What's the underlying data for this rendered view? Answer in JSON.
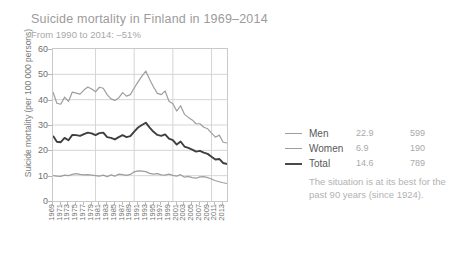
{
  "header": {
    "title": "Suicide mortality in Finland in 1969–2014",
    "subtitle": "From 1990 to 2014: –51%"
  },
  "annotation": {
    "text": "The situation is at its best for the past 90 years (since 1924)."
  },
  "legend": {
    "rows": [
      {
        "label": "Men",
        "rate": "22.9",
        "count": "599",
        "color": "#9e9e9e"
      },
      {
        "label": "Women",
        "rate": "6.9",
        "count": "190",
        "color": "#9e9e9e"
      },
      {
        "label": "Total",
        "rate": "14.6",
        "count": "789",
        "color": "#4a4a4a"
      }
    ]
  },
  "chart_data": {
    "type": "line",
    "title": "Suicide mortality in Finland in 1969–2014",
    "subtitle": "From 1990 to 2014: –51%",
    "xlabel": "",
    "ylabel": "Suicide mortality (per 100 000 persons)",
    "ylim": [
      0,
      60
    ],
    "yticks": [
      0,
      10,
      20,
      30,
      40,
      50,
      60
    ],
    "xlim": [
      1969,
      2014
    ],
    "grid": true,
    "legend_position": "right",
    "x": [
      1969,
      1970,
      1971,
      1972,
      1973,
      1974,
      1975,
      1976,
      1977,
      1978,
      1979,
      1980,
      1981,
      1982,
      1983,
      1984,
      1985,
      1986,
      1987,
      1988,
      1989,
      1990,
      1991,
      1992,
      1993,
      1994,
      1995,
      1996,
      1997,
      1998,
      1999,
      2000,
      2001,
      2002,
      2003,
      2004,
      2005,
      2006,
      2007,
      2008,
      2009,
      2010,
      2011,
      2012,
      2013,
      2014
    ],
    "xtick_labels": [
      "1969",
      "1971",
      "1973",
      "1975",
      "1977",
      "1979",
      "1981",
      "1983",
      "1985",
      "1987",
      "1989",
      "1991",
      "1993",
      "1995",
      "1997",
      "1999",
      "2001",
      "2003",
      "2005",
      "2007",
      "2009",
      "2011",
      "2013"
    ],
    "series": [
      {
        "name": "Men",
        "color": "#9e9e9e",
        "values": [
          43.0,
          38.6,
          38.2,
          41.0,
          39.3,
          43.0,
          42.6,
          42.2,
          43.8,
          45.0,
          44.2,
          43.1,
          44.9,
          44.5,
          42.0,
          40.3,
          39.7,
          40.7,
          42.8,
          41.4,
          42.0,
          44.6,
          47.0,
          49.3,
          51.3,
          48.0,
          45.0,
          42.5,
          42.0,
          43.4,
          39.4,
          38.4,
          35.5,
          37.6,
          34.2,
          33.0,
          32.0,
          30.5,
          30.5,
          29.1,
          28.5,
          26.8,
          25.2,
          26.0,
          23.2,
          22.9
        ]
      },
      {
        "name": "Women",
        "color": "#9e9e9e",
        "values": [
          10.0,
          9.8,
          9.7,
          10.2,
          10.0,
          10.5,
          10.8,
          10.5,
          10.3,
          10.4,
          10.2,
          10.0,
          9.8,
          10.2,
          9.6,
          10.3,
          9.8,
          10.6,
          10.4,
          10.1,
          10.5,
          11.5,
          11.9,
          11.8,
          11.6,
          10.9,
          10.6,
          10.8,
          10.3,
          10.2,
          10.6,
          10.1,
          9.8,
          10.4,
          9.4,
          9.7,
          9.2,
          9.0,
          9.5,
          9.6,
          9.2,
          8.7,
          8.0,
          7.6,
          7.2,
          6.9
        ]
      },
      {
        "name": "Total",
        "color": "#3f3f3f",
        "values": [
          25.7,
          23.4,
          23.2,
          24.9,
          24.0,
          26.1,
          26.0,
          25.7,
          26.4,
          27.0,
          26.7,
          26.0,
          26.8,
          27.0,
          25.2,
          24.9,
          24.3,
          25.2,
          26.0,
          25.2,
          25.6,
          27.4,
          29.0,
          30.0,
          30.9,
          29.0,
          27.3,
          26.1,
          25.7,
          26.3,
          24.6,
          24.0,
          22.3,
          23.5,
          21.5,
          21.0,
          20.3,
          19.5,
          19.8,
          19.1,
          18.6,
          17.5,
          16.4,
          16.6,
          15.0,
          14.6
        ]
      }
    ]
  }
}
